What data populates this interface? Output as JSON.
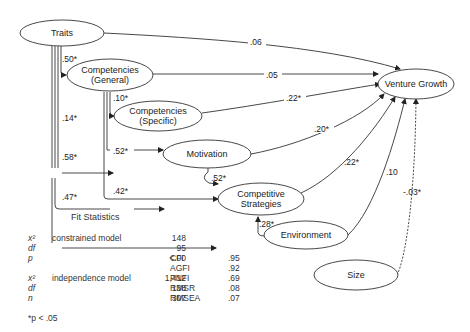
{
  "diagram": {
    "nodes": {
      "traits": "Traits",
      "comp_general_1": "Competencies",
      "comp_general_2": "(General)",
      "comp_specific_1": "Competencies",
      "comp_specific_2": "(Specific)",
      "motivation": "Motivation",
      "strategies_1": "Competitive",
      "strategies_2": "Strategies",
      "environment": "Environment",
      "size": "Size",
      "venture_growth": "Venture Growth"
    },
    "paths": {
      "traits_vg": ".06",
      "traits_cg": ".50*",
      "traits_cs": ".14*",
      "traits_mot": ".58*",
      "traits_strat": ".47*",
      "cg_vg": ".05",
      "cg_cs": ".10*",
      "cg_mot": ".52*",
      "cg_strat": ".42*",
      "cs_vg": ".22*",
      "mot_vg": ".20*",
      "mot_strat": ".52*",
      "strat_vg": ".22*",
      "env_strat": ".28*",
      "env_vg": ".10",
      "size_vg": "-.03*"
    }
  },
  "fit_statistics": {
    "title": "Fit Statistics",
    "rows": [
      {
        "symbol": "x²",
        "desc": "constrained model",
        "value": "148",
        "index": "",
        "index_value": ""
      },
      {
        "symbol": "df",
        "desc": "",
        "value": "95",
        "index": "",
        "index_value": ""
      },
      {
        "symbol": "p",
        "desc": "",
        "value": "<.00",
        "index": "CFI",
        "index_value": ".95"
      },
      {
        "symbol": "",
        "desc": "",
        "value": "",
        "index": "AGFI",
        "index_value": ".92"
      },
      {
        "symbol": "x²",
        "desc": "independence model",
        "value": "1,412",
        "index": "PNFI",
        "index_value": ".69"
      },
      {
        "symbol": "df",
        "desc": "",
        "value": "138",
        "index": "RMSR",
        "index_value": ".08"
      },
      {
        "symbol": "n",
        "desc": "",
        "value": "307",
        "index": "RMSEA",
        "index_value": ".07"
      }
    ],
    "note": "*p < .05"
  }
}
